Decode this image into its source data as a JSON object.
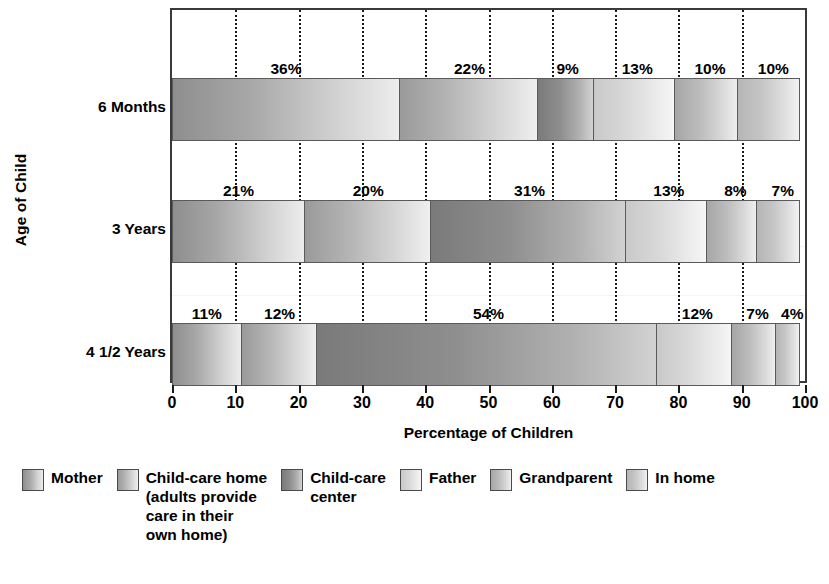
{
  "chart_data": {
    "type": "bar",
    "orientation": "horizontal",
    "stacked": true,
    "title": "",
    "xlabel": "Percentage of Children",
    "ylabel": "Age of Child",
    "categories": [
      "6 Months",
      "3 Years",
      "4 1/2 Years"
    ],
    "xlim": [
      0,
      100
    ],
    "xticks": [
      0,
      10,
      20,
      30,
      40,
      50,
      60,
      70,
      80,
      90,
      100
    ],
    "xticklabels": [
      "0",
      "10",
      "20",
      "30",
      "40",
      "50",
      "60",
      "70",
      "80",
      "90",
      "100"
    ],
    "grid": "vertical-dotted",
    "legend_position": "bottom",
    "series": [
      {
        "name": "Mother",
        "key": "mother",
        "values": [
          36,
          21,
          11
        ]
      },
      {
        "name": "Child-care home\n(adults provide\ncare in their\nown home)",
        "key": "ccHome",
        "values": [
          22,
          20,
          12
        ]
      },
      {
        "name": "Child-care\ncenter",
        "key": "ccCenter",
        "values": [
          9,
          31,
          54
        ]
      },
      {
        "name": "Father",
        "key": "father",
        "values": [
          13,
          13,
          12
        ]
      },
      {
        "name": "Grandparent",
        "key": "grandparent",
        "values": [
          10,
          8,
          7
        ]
      },
      {
        "name": "In home",
        "key": "inHome",
        "values": [
          10,
          7,
          4
        ]
      }
    ],
    "value_labels": [
      [
        "36%",
        "22%",
        "9%",
        "13%",
        "10%",
        "10%"
      ],
      [
        "21%",
        "20%",
        "31%",
        "13%",
        "8%",
        "7%"
      ],
      [
        "11%",
        "12%",
        "54%",
        "12%",
        "7%",
        "4%"
      ]
    ],
    "colors": {
      "mother": "#a8a8a8",
      "ccHome": "#b4b4b4",
      "ccCenter": "#8e8e8e",
      "father": "#dcdcdc",
      "grandparent": "#bcbcbc",
      "inHome": "#c6c6c6",
      "frame": "#3a3a3a",
      "gridline": "#1a1a1a",
      "text": "#000000"
    }
  },
  "axes": {
    "y_title": "Age of Child",
    "x_title": "Percentage of Children",
    "categories": [
      "6 Months",
      "3 Years",
      "4 1/2 Years"
    ],
    "xticklabels": [
      "0",
      "10",
      "20",
      "30",
      "40",
      "50",
      "60",
      "70",
      "80",
      "90",
      "100"
    ]
  },
  "legend": {
    "items": [
      {
        "label": "Mother",
        "shade": "sh-mother"
      },
      {
        "label": "Child-care home\n(adults provide\ncare in their\nown home)",
        "shade": "sh-ccHome"
      },
      {
        "label": "Child-care\ncenter",
        "shade": "sh-ccCenter"
      },
      {
        "label": "Father",
        "shade": "sh-father"
      },
      {
        "label": "Grandparent",
        "shade": "sh-grandparent"
      },
      {
        "label": "In home",
        "shade": "sh-inHome"
      }
    ]
  }
}
